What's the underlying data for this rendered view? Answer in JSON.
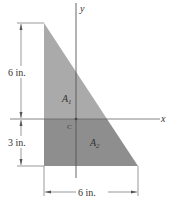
{
  "figure": {
    "axes": {
      "x_label": "x",
      "y_label": "y",
      "origin_label": "C"
    },
    "regions": [
      {
        "name": "A",
        "subscript": "1",
        "color": "#a9a9a9"
      },
      {
        "name": "A",
        "subscript": "2",
        "color": "#8c8c8c"
      }
    ],
    "dimensions": {
      "height_upper": "6 in.",
      "height_lower": "3 in.",
      "width_bottom": "6 in."
    }
  }
}
